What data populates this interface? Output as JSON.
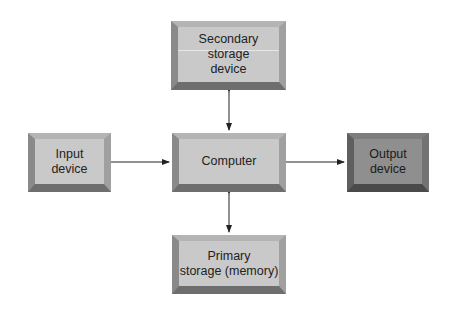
{
  "diagram": {
    "nodes": [
      {
        "id": "secondary",
        "label": "Secondary storage device"
      },
      {
        "id": "input",
        "label": "Input device"
      },
      {
        "id": "computer",
        "label": "Computer"
      },
      {
        "id": "output",
        "label": "Output device"
      },
      {
        "id": "primary",
        "label": "Primary storage (memory)"
      }
    ],
    "labels": {
      "secondary_l1": "Secondary",
      "secondary_l2": "storage",
      "secondary_l3": "device",
      "input_l1": "Input",
      "input_l2": "device",
      "computer": "Computer",
      "output_l1": "Output",
      "output_l2": "device",
      "primary_l1": "Primary",
      "primary_l2": "storage (memory)"
    },
    "edges": [
      {
        "from": "secondary",
        "to": "computer",
        "direction": "both"
      },
      {
        "from": "input",
        "to": "computer",
        "direction": "forward"
      },
      {
        "from": "computer",
        "to": "output",
        "direction": "forward"
      },
      {
        "from": "computer",
        "to": "primary",
        "direction": "both"
      }
    ],
    "colors": {
      "box_light": "#c9c9c9",
      "box_dark": "#8f8f8f",
      "arrow": "#222222"
    }
  }
}
